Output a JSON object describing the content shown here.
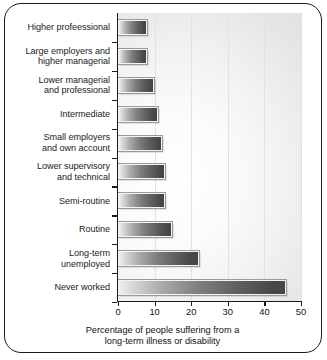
{
  "chart_data": {
    "type": "bar",
    "orientation": "horizontal",
    "title": "",
    "xlabel": "Percentage of people suffering from a long-term illness or disability",
    "xlabel_lines": [
      "Percentage of people suffering from a",
      "long-term illness or disability"
    ],
    "ylabel": "",
    "xlim": [
      0,
      50
    ],
    "xticks": [
      0,
      10,
      20,
      30,
      40,
      50
    ],
    "xticklabels": [
      "0",
      "10",
      "20",
      "30",
      "40",
      "50"
    ],
    "grid": "vertical",
    "legend": "none",
    "categories": [
      "Higher profeessional",
      "Large employers and higher managerial",
      "Lower managerial and professional",
      "Intermediate",
      "Small employers and own account",
      "Lower supervisory and technical",
      "Semi-routine",
      "Routine",
      "Long-term unemployed",
      "Never worked"
    ],
    "category_lines": [
      [
        "Higher profeessional"
      ],
      [
        "Large employers and",
        "higher managerial"
      ],
      [
        "Lower managerial",
        "and professional"
      ],
      [
        "Intermediate"
      ],
      [
        "Small employers",
        "and own account"
      ],
      [
        "Lower supervisory",
        "and technical"
      ],
      [
        "Semi-routine"
      ],
      [
        "Routine"
      ],
      [
        "Long-term",
        "unemployed"
      ],
      [
        "Never worked"
      ]
    ],
    "values": [
      8,
      8,
      9.8,
      11,
      12,
      12.8,
      12.8,
      14.7,
      22,
      46
    ],
    "bar_color_start": "#efefef",
    "bar_color_end": "#444444",
    "axis_color": "#1a1a1a",
    "plot_background": "#f2f2f2"
  }
}
